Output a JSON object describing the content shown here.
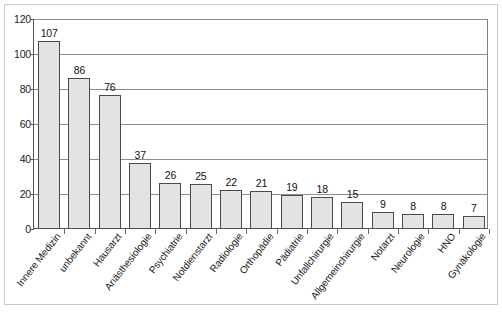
{
  "chart_data": {
    "type": "bar",
    "title": "",
    "subtitle": "",
    "xlabel": "",
    "ylabel": "",
    "ylim": [
      0,
      120
    ],
    "yticks": [
      0,
      20,
      40,
      60,
      80,
      100,
      120
    ],
    "grid": true,
    "legend": null,
    "categories": [
      "Innere Medizin",
      "unbekannt",
      "Hausarzt",
      "Anästhesiologie",
      "Psychiatrie",
      "Notdienstarzt",
      "Radiologie",
      "Orthopädie",
      "Pädiatrie",
      "Unfallchirurgie",
      "Allgemeinchirurgie",
      "Notarzt",
      "Neurologie",
      "HNO",
      "Gynäkologie"
    ],
    "values": [
      107,
      86,
      76,
      37,
      26,
      25,
      22,
      21,
      19,
      18,
      15,
      9,
      8,
      8,
      7
    ],
    "bar_fill_color": "#e3e3e3",
    "bar_edge_color": "#4a4a4a",
    "gridline_color": "#8d8d8d",
    "axis_color": "#555555",
    "background_color": "#ffffff"
  }
}
